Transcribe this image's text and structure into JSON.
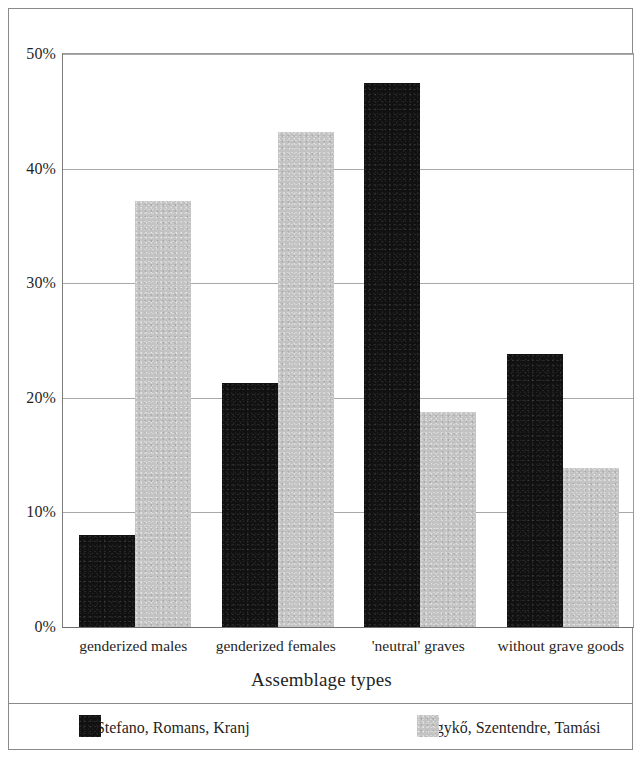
{
  "chart_data": {
    "type": "bar",
    "title": "",
    "xlabel": "Assemblage types",
    "ylabel": "",
    "categories": [
      "genderized males",
      "genderized females",
      "'neutral' graves",
      "without grave goods"
    ],
    "series": [
      {
        "name": "S. Stefano, Romans, Kranj",
        "color": "#111111",
        "values": [
          8.0,
          21.3,
          47.5,
          23.8
        ]
      },
      {
        "name": "Hegykő, Szentendre, Tamási",
        "color": "#c3c3c3",
        "values": [
          37.2,
          43.2,
          18.8,
          13.9
        ]
      }
    ],
    "ylim": [
      0,
      50
    ],
    "ytick_values": [
      0,
      10,
      20,
      30,
      40,
      50
    ],
    "ytick_labels": [
      "0%",
      "10%",
      "20%",
      "30%",
      "40%",
      "50%"
    ],
    "grid": true,
    "legend_position": "bottom"
  },
  "axes": {
    "x_title": "Assemblage types"
  },
  "legend": {
    "items": [
      {
        "label": "S. Stefano, Romans, Kranj",
        "color": "#111111"
      },
      {
        "label": "Hegykő, Szentendre, Tamási",
        "color": "#c3c3c3"
      }
    ]
  }
}
